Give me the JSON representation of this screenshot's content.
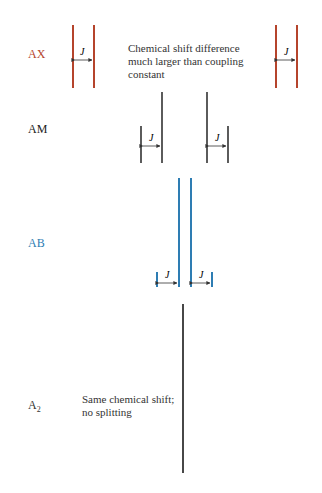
{
  "colors": {
    "ax": "#b5442c",
    "am": "#333333",
    "ab": "#2e7db3",
    "a2": "#333333"
  },
  "rows": [
    {
      "id": "AX",
      "label": "AX",
      "note": [
        "Chemical shift difference",
        "much larger than coupling",
        "constant"
      ],
      "coupling_label": "J"
    },
    {
      "id": "AM",
      "label": "AM",
      "coupling_label": "J"
    },
    {
      "id": "AB",
      "label": "AB",
      "coupling_label": "J"
    },
    {
      "id": "A2",
      "label": "A",
      "subscript": "2",
      "note": [
        "Same chemical shift;",
        "no splitting"
      ]
    }
  ]
}
